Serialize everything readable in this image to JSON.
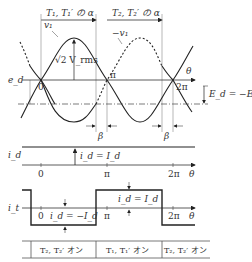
{
  "diagram": {
    "top_spans": [
      {
        "label": "T₁, T₁′ の α"
      },
      {
        "label": "T₂, T₂′ の α"
      }
    ],
    "waveform_panel": {
      "axis_label": "e_d",
      "theta_label": "θ",
      "curve_v1_label": "v₁",
      "curve_neg_v1_label": "−v₁",
      "amplitude_label": "√2 V_rms",
      "ticks": [
        "0",
        "π",
        "2π"
      ],
      "dc_level_label": "E_d = −E_o",
      "beta_labels": [
        "β",
        "β"
      ]
    },
    "id_panel": {
      "axis_label": "i_d",
      "value_label": "i_d = I_d",
      "ticks": [
        "0",
        "π",
        "2π"
      ],
      "theta_label": "θ"
    },
    "it_panel": {
      "axis_label": "i_t",
      "neg_label": "i_d = −I_d",
      "pos_label": "i_d = I_d",
      "ticks": [
        "0",
        "π",
        "2π"
      ],
      "theta_label": "θ"
    },
    "state_table": {
      "cells": [
        {
          "label": "T₂, T₂′ オン"
        },
        {
          "label": "T₁, T₁′ オン"
        },
        {
          "label": "T₂, T₂′ オン"
        }
      ]
    },
    "colors": {
      "line": "#333333",
      "guide": "#888888",
      "background": "#ffffff"
    }
  }
}
